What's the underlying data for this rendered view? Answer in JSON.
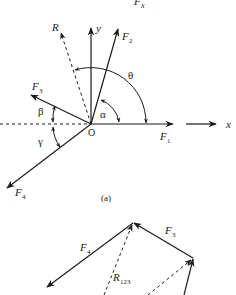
{
  "figure": {
    "top_label": {
      "main": "F",
      "sub": "x"
    },
    "part_a": {
      "caption": "(a)",
      "origin_label": "O",
      "axes": {
        "x_label": "x",
        "y_label": "y"
      },
      "forces": [
        {
          "name": "F1",
          "main": "F",
          "sub": "1"
        },
        {
          "name": "F2",
          "main": "F",
          "sub": "2"
        },
        {
          "name": "F3",
          "main": "F",
          "sub": "3"
        },
        {
          "name": "F4",
          "main": "F",
          "sub": "4"
        }
      ],
      "resultant": {
        "label": "R"
      },
      "angles": {
        "theta": "θ",
        "alpha": "α",
        "beta": "β",
        "gamma": "γ"
      }
    },
    "part_b": {
      "forces": [
        {
          "name": "F4",
          "main": "F",
          "sub": "4"
        },
        {
          "name": "F3",
          "main": "F",
          "sub": "3"
        }
      ],
      "partial_resultant": {
        "main": "R",
        "sub": "123"
      }
    },
    "colors": {
      "stroke": "#1a1a1a",
      "background": "#ffffff"
    }
  }
}
